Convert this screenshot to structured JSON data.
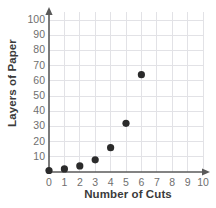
{
  "chart_data": {
    "type": "scatter",
    "title": "",
    "xlabel": "Number of Cuts",
    "ylabel": "Layers of Paper",
    "x": [
      0,
      1,
      2,
      3,
      4,
      5,
      6
    ],
    "values": [
      1,
      2,
      4,
      8,
      16,
      32,
      64
    ],
    "points": [
      {
        "x": 0,
        "y": 1
      },
      {
        "x": 1,
        "y": 2
      },
      {
        "x": 2,
        "y": 4
      },
      {
        "x": 3,
        "y": 8
      },
      {
        "x": 4,
        "y": 16
      },
      {
        "x": 5,
        "y": 32
      },
      {
        "x": 6,
        "y": 64
      }
    ],
    "xlim": [
      0,
      10
    ],
    "ylim": [
      0,
      105
    ],
    "xticks": [
      0,
      1,
      2,
      3,
      4,
      5,
      6,
      7,
      8,
      9,
      10
    ],
    "yticks": [
      10,
      20,
      30,
      40,
      50,
      60,
      70,
      80,
      90,
      100
    ],
    "xtick_labels": [
      "0",
      "1",
      "2",
      "3",
      "4",
      "5",
      "6",
      "7",
      "8",
      "9",
      "10"
    ],
    "ytick_labels": [
      "10",
      "20",
      "30",
      "40",
      "50",
      "60",
      "70",
      "80",
      "90",
      "100"
    ],
    "grid": true,
    "legend": false,
    "marker_color": "#2b2b2b",
    "grid_color": "#e2e2e6",
    "axis_color": "#5a5a5a",
    "tick_label_color": "#6f6f6f",
    "axis_title_color": "#3b3b3b"
  },
  "axes": {
    "x_title": "Number of Cuts",
    "y_title": "Layers of Paper"
  }
}
